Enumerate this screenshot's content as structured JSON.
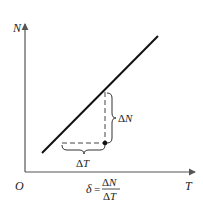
{
  "diagram": {
    "type": "line-graph-slope-illustration",
    "axes": {
      "y_label": "N",
      "x_label": "T",
      "origin_label": "O"
    },
    "line": {
      "from": [
        42,
        153
      ],
      "to": [
        158,
        36
      ],
      "color": "#111111"
    },
    "increments": {
      "delta_n_label": "ΔN",
      "delta_t_label": "ΔT"
    },
    "formula": {
      "lhs": "δ",
      "equals": "=",
      "numerator": "ΔN",
      "denominator": "ΔT"
    }
  }
}
